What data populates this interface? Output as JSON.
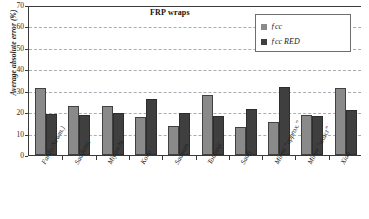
{
  "chart_data": {
    "type": "bar",
    "title": "FRP wraps",
    "xlabel": "",
    "ylabel": "Average absolute error (%)",
    "ylim": [
      0,
      70
    ],
    "yticks": [
      0,
      10,
      20,
      30,
      40,
      50,
      60,
      70
    ],
    "grid": "horizontal-dashed",
    "legend_position": "top-right",
    "categories": [
      "Fardis/Newm.)",
      "Saadatm.",
      "Miyauchi",
      "Kono",
      "Saaman",
      "Toutanji",
      "Saafi",
      "Mirmi “approx.”",
      "Mirmi “exact”",
      "Xiao"
    ],
    "series": [
      {
        "name": "f cc",
        "color": "#8a8a8a",
        "values": [
          31.4,
          22.8,
          23.0,
          17.6,
          13.4,
          27.8,
          13.3,
          15.5,
          18.9,
          31.4
        ]
      },
      {
        "name": "f cc RED",
        "color": "#3f3f3f",
        "values": [
          19.0,
          18.6,
          19.6,
          26.0,
          19.5,
          18.1,
          21.4,
          31.8,
          18.3,
          21.0
        ]
      }
    ]
  },
  "legend": {
    "items": [
      {
        "label_main": "f",
        "label_sub": "cc",
        "label_suffix": "",
        "swatch": "#8a8a8a"
      },
      {
        "label_main": "f",
        "label_sub": "cc",
        "label_suffix": "RED",
        "swatch": "#3f3f3f"
      }
    ],
    "item_0_text": "ƒcc",
    "item_1_text": "ƒcc RED"
  },
  "axis": {
    "y_title": "Average absolute error (%)",
    "y_tick_labels": [
      "70",
      "60",
      "50",
      "40",
      "30",
      "20",
      "10",
      "0"
    ]
  },
  "colors": {
    "series_light": "#8a8a8a",
    "series_dark": "#3f3f3f",
    "gridline": "#9aa0a6",
    "axis": "#3a3a3a",
    "background": "#ffffff"
  }
}
